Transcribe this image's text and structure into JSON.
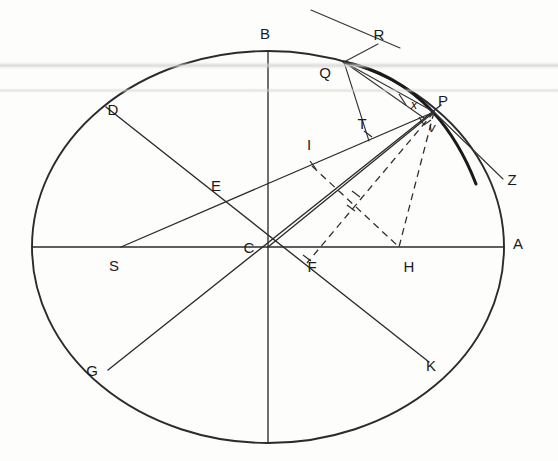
{
  "figure": {
    "background_color": "#fdfdfc",
    "ink_color": "#2b2b2b",
    "canvas": {
      "width": 558,
      "height": 461
    }
  },
  "circle": {
    "center_label": "C",
    "center": {
      "x": 268,
      "y": 247
    },
    "rx": 236,
    "ry": 196
  },
  "labels": [
    {
      "id": "B",
      "text": "B",
      "x": 265,
      "y": 39,
      "size": 15,
      "italic": false
    },
    {
      "id": "R",
      "text": "R",
      "x": 379,
      "y": 40,
      "size": 15,
      "italic": false
    },
    {
      "id": "Q",
      "text": "Q",
      "x": 325,
      "y": 78,
      "size": 15,
      "italic": false
    },
    {
      "id": "D",
      "text": "D",
      "x": 113,
      "y": 115,
      "size": 15,
      "italic": false
    },
    {
      "id": "P",
      "text": "P",
      "x": 443,
      "y": 106,
      "size": 15,
      "italic": false
    },
    {
      "id": "x",
      "text": "x",
      "x": 414,
      "y": 109,
      "size": 13,
      "italic": true
    },
    {
      "id": "v",
      "text": "v",
      "x": 432,
      "y": 130,
      "size": 13,
      "italic": true
    },
    {
      "id": "T",
      "text": "T",
      "x": 362,
      "y": 129,
      "size": 15,
      "italic": false
    },
    {
      "id": "I",
      "text": "I",
      "x": 309,
      "y": 150,
      "size": 15,
      "italic": false
    },
    {
      "id": "Z",
      "text": "Z",
      "x": 512,
      "y": 185,
      "size": 15,
      "italic": false
    },
    {
      "id": "E",
      "text": "E",
      "x": 216,
      "y": 191,
      "size": 15,
      "italic": false
    },
    {
      "id": "A",
      "text": "A",
      "x": 518,
      "y": 249,
      "size": 15,
      "italic": false
    },
    {
      "id": "C",
      "text": "C",
      "x": 249,
      "y": 250,
      "size": 15,
      "italic": false
    },
    {
      "id": "S",
      "text": "S",
      "x": 114,
      "y": 271,
      "size": 15,
      "italic": false
    },
    {
      "id": "F",
      "text": "F",
      "x": 312,
      "y": 272,
      "size": 15,
      "italic": false
    },
    {
      "id": "H",
      "text": "H",
      "x": 409,
      "y": 272,
      "size": 15,
      "italic": false
    },
    {
      "id": "G",
      "text": "G",
      "x": 92,
      "y": 376,
      "size": 15,
      "italic": false
    },
    {
      "id": "K",
      "text": "K",
      "x": 431,
      "y": 371,
      "size": 15,
      "italic": false
    }
  ],
  "points": {
    "A": {
      "x": 504,
      "y": 247
    },
    "B": {
      "x": 268,
      "y": 51
    },
    "C": {
      "x": 268,
      "y": 247
    },
    "D": {
      "x": 106,
      "y": 107
    },
    "E": {
      "x": 216,
      "y": 197
    },
    "F": {
      "x": 308,
      "y": 263
    },
    "G": {
      "x": 108,
      "y": 370
    },
    "H": {
      "x": 399,
      "y": 247
    },
    "I": {
      "x": 312,
      "y": 166
    },
    "K": {
      "x": 429,
      "y": 362
    },
    "P": {
      "x": 434,
      "y": 112
    },
    "Q": {
      "x": 345,
      "y": 62
    },
    "R": {
      "x": 373,
      "y": 52
    },
    "S": {
      "x": 121,
      "y": 247
    },
    "T": {
      "x": 370,
      "y": 140
    },
    "Z": {
      "x": 501,
      "y": 180
    },
    "V_bottom": {
      "x": 268,
      "y": 443
    }
  },
  "segments": {
    "solid": [
      {
        "name": "diameter-horizontal-SA",
        "from": "left-rim",
        "to": "A"
      },
      {
        "name": "diameter-vertical-B-bottom",
        "from": "B",
        "to": "bottom-rim"
      },
      {
        "name": "diameter-DK",
        "from": "D",
        "to": "K"
      },
      {
        "name": "diameter-GP-axis",
        "from": "G",
        "to": "upper-right-rim"
      },
      {
        "name": "chord-S-to-P",
        "from": "S",
        "to": "P"
      },
      {
        "name": "chord-C-to-P",
        "from": "C",
        "to": "P"
      },
      {
        "name": "tangent-Q-R",
        "from": "Q",
        "to": "R-extended"
      },
      {
        "name": "ray-Q-to-P",
        "from": "Q",
        "to": "P"
      },
      {
        "name": "ray-Q-to-T",
        "from": "Q",
        "to": "T"
      },
      {
        "name": "tangent-P-Z",
        "from": "P",
        "to": "Z"
      }
    ],
    "dashed": [
      {
        "name": "perpendicular-P-to-H",
        "from": "P",
        "to": "H"
      },
      {
        "name": "chord-P-to-F",
        "from": "P",
        "to": "F"
      },
      {
        "name": "segment-I-to-H",
        "from": "I",
        "to": "H"
      },
      {
        "name": "segment-P-to-perp-foot",
        "from": "P",
        "to": "perp-foot"
      }
    ]
  },
  "marks": {
    "right_angle_at_P": true,
    "perpendicular_tick_at_I": true,
    "perpendicular_tick_at_F": true,
    "perpendicular_tick_at_T": true,
    "perpendicular_tick_at_H": true
  }
}
